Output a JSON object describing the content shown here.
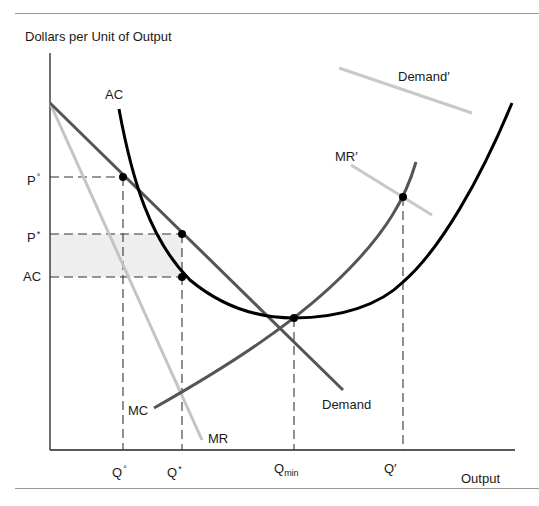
{
  "figure": {
    "y_axis_title": "Dollars per Unit of Output",
    "x_axis_title": "Output",
    "colors": {
      "ac_curve": "#000000",
      "demand": "#555555",
      "mc": "#555555",
      "mr": "#c4c4c4",
      "demand_prime": "#c8c8c8",
      "mr_prime": "#c8c8c8",
      "profit_rect": "#eeeeee",
      "dashed_guides": "#333333"
    },
    "curve_labels": {
      "ac": "AC",
      "demand": "Demand",
      "mr": "MR",
      "mc": "MC",
      "demand_prime": "Demand′",
      "mr_prime": "MR′"
    },
    "y_ticks": [
      {
        "base": "P",
        "mark": "°"
      },
      {
        "base": "P",
        "mark": "*"
      },
      {
        "base": "AC",
        "mark": ""
      }
    ],
    "x_ticks": [
      {
        "base": "Q",
        "mark": "°",
        "sub": ""
      },
      {
        "base": "Q",
        "mark": "*",
        "sub": ""
      },
      {
        "base": "Q",
        "mark": "",
        "sub": "min"
      },
      {
        "base": "Q′",
        "mark": "",
        "sub": ""
      }
    ]
  }
}
